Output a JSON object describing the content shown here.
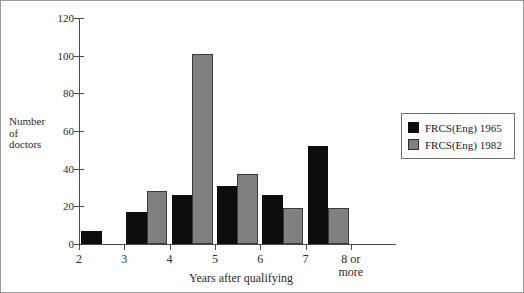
{
  "chart_data": {
    "type": "bar",
    "title": "",
    "xlabel": "Years after qualifying",
    "ylabel": "Number of doctors",
    "ylabel_lines": [
      "Number",
      "of",
      "doctors"
    ],
    "categories": [
      "2",
      "3",
      "4",
      "5",
      "6",
      "7",
      "8 or more"
    ],
    "category_label_lines": [
      [
        "2"
      ],
      [
        "3"
      ],
      [
        "4"
      ],
      [
        "5"
      ],
      [
        "6"
      ],
      [
        "7"
      ],
      [
        "8 or",
        "more"
      ]
    ],
    "series": [
      {
        "name": "FRCS(Eng) 1965",
        "color": "#0d0d0d",
        "values": [
          7,
          17,
          26,
          31,
          26,
          52,
          0
        ]
      },
      {
        "name": "FRCS(Eng) 1982",
        "color": "#808080",
        "values": [
          0,
          28,
          101,
          37,
          19,
          19,
          0
        ]
      }
    ],
    "ylim": [
      0,
      120
    ],
    "ytick_values": [
      0,
      20,
      40,
      60,
      80,
      100,
      120
    ],
    "ytick_labels": [
      "0",
      "20",
      "40",
      "60",
      "80",
      "100",
      "120"
    ],
    "grid": false,
    "legend_position": "right"
  },
  "legend": {
    "entries": [
      {
        "label": "FRCS(Eng) 1965",
        "swatch": "black-swatch"
      },
      {
        "label": "FRCS(Eng) 1982",
        "swatch": "gray-swatch"
      }
    ]
  }
}
